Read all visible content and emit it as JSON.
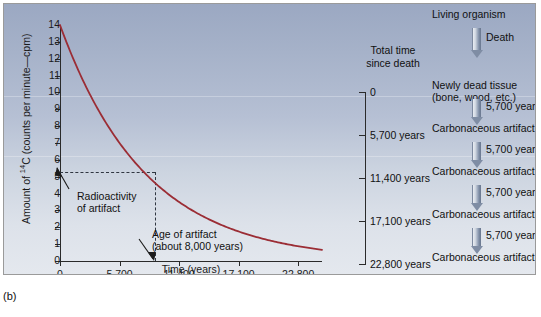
{
  "figure": {
    "label": "(b)"
  },
  "chart_data": {
    "type": "line",
    "title": "",
    "xlabel": "Time (years)",
    "ylabel": "Amount of 14C (counts per minute—cpm)",
    "ylabel_parts": {
      "pre": "Amount of ",
      "sup": "14",
      "post": "C (counts per minute—cpm)"
    },
    "xlim": [
      0,
      25080
    ],
    "ylim": [
      0,
      14
    ],
    "grid": false,
    "legend": null,
    "half_life_years": 5700,
    "initial_cpm": 14,
    "xticks": [
      0,
      5700,
      11400,
      17100,
      22800
    ],
    "xticklabels": [
      "0",
      "5,700",
      "11,400",
      "17,100",
      "22,800"
    ],
    "yticks": [
      0,
      1,
      2,
      3,
      4,
      5,
      6,
      7,
      8,
      9,
      10,
      11,
      12,
      13,
      14
    ],
    "yticklabels": [
      "0",
      "1",
      "2",
      "3",
      "4",
      "5",
      "6",
      "7",
      "8",
      "9",
      "10",
      "11",
      "12",
      "13",
      "14"
    ],
    "series": [
      {
        "name": "Carbon-14 decay",
        "color": "#9b2d35",
        "x": [
          0,
          1425,
          2850,
          4275,
          5700,
          8550,
          11400,
          14250,
          17100,
          19950,
          22800,
          25080
        ],
        "y": [
          14.0,
          12.23,
          10.68,
          9.33,
          7.0,
          5.35,
          3.5,
          2.67,
          1.75,
          1.34,
          0.875,
          0.7
        ]
      }
    ],
    "annotations": [
      {
        "name": "radioactivity-of-artifact",
        "text": "Radioactivity\nof artifact",
        "points_to_x": 0,
        "points_to_y": 5.3
      },
      {
        "name": "age-of-artifact",
        "text": "Age of artifact\n(about 8,000 years)",
        "points_to_x": 8000,
        "points_to_y": 0
      }
    ],
    "guide_lines": {
      "y_value": 5.3,
      "x_value": 8000,
      "style": "dashed"
    }
  },
  "annotations": {
    "radioactivity_line1": "Radioactivity",
    "radioactivity_line2": "of artifact",
    "age_line1": "Age of artifact",
    "age_line2": "(about 8,000 years)"
  },
  "time_column": {
    "title_line1": "Total time",
    "title_line2": "since death",
    "items": [
      "0",
      "5,700 years",
      "11,400 years",
      "17,100 years",
      "22,800 years"
    ]
  },
  "flow": {
    "nodes": [
      {
        "line1": "Living organism",
        "line2": ""
      },
      {
        "line1": "Newly dead tissue",
        "line2": "(bone, wood, etc.)"
      },
      {
        "line1": "Carbonaceous artifact",
        "line2": ""
      },
      {
        "line1": "Carbonaceous artifact",
        "line2": ""
      },
      {
        "line1": "Carbonaceous artifact",
        "line2": ""
      },
      {
        "line1": "Carbonaceous artifact",
        "line2": ""
      }
    ],
    "arrow_labels": [
      "Death",
      "5,700 years",
      "5,700 years",
      "5,700 years",
      "5,700 years"
    ]
  },
  "colors": {
    "curve": "#9b2d35",
    "axis": "#2a2a2a",
    "text": "#111111",
    "arrow": "#7f8da4",
    "panel_top": "#9ba8c2",
    "panel_bottom": "#e4e8ee"
  }
}
